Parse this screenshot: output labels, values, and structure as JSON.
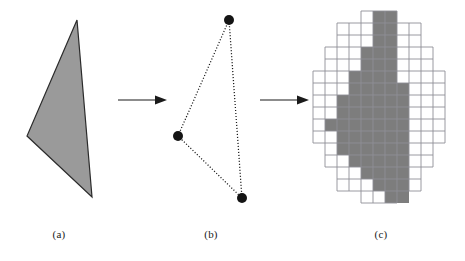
{
  "figure": {
    "background_color": "#ffffff",
    "width": 465,
    "height": 261
  },
  "captions": {
    "a": "(a)",
    "b": "(b)",
    "c": "(c)"
  },
  "colors": {
    "fill_gray": "#9a9a9a",
    "raster_gray": "#7d7d7d",
    "outline_black": "#1a1a1a",
    "grid_line": "#8f8f96",
    "vertex_dot": "#141414",
    "arrow": "#1a1a1a"
  },
  "panel_a": {
    "label": "filled-triangle",
    "shape": "triangle",
    "fill": "#9a9a9a",
    "stroke": "#2b2b2b",
    "stroke_width": 1.2,
    "vertices": [
      {
        "name": "apex-top",
        "x": 77,
        "y": 20
      },
      {
        "name": "left",
        "x": 27,
        "y": 136
      },
      {
        "name": "bottom",
        "x": 92,
        "y": 197
      }
    ]
  },
  "panel_b": {
    "label": "wireframe-triangle-with-vertices",
    "edge_style": "dotted",
    "edge_color": "#1a1a1a",
    "vertex_radius": 5,
    "vertex_color": "#141414",
    "vertices": [
      {
        "name": "apex-top",
        "x": 74,
        "y": 20
      },
      {
        "name": "left",
        "x": 23,
        "y": 136
      },
      {
        "name": "bottom",
        "x": 87,
        "y": 198
      }
    ]
  },
  "panel_c": {
    "label": "rasterized-triangle-on-pixel-grid",
    "cell_size": 12,
    "grid_origin": {
      "x": 8,
      "y": 11
    },
    "grid_cols": 11,
    "grid_rows": 16,
    "grid_line_color": "#8f8f96",
    "grid_line_width": 0.9,
    "pixel_color": "#7d7d7d",
    "filled_runs": [
      {
        "row": 0,
        "col_start": 5,
        "col_end": 6
      },
      {
        "row": 1,
        "col_start": 5,
        "col_end": 6
      },
      {
        "row": 2,
        "col_start": 5,
        "col_end": 6
      },
      {
        "row": 3,
        "col_start": 4,
        "col_end": 6
      },
      {
        "row": 4,
        "col_start": 4,
        "col_end": 6
      },
      {
        "row": 5,
        "col_start": 3,
        "col_end": 6
      },
      {
        "row": 6,
        "col_start": 3,
        "col_end": 7
      },
      {
        "row": 7,
        "col_start": 2,
        "col_end": 7
      },
      {
        "row": 8,
        "col_start": 2,
        "col_end": 7
      },
      {
        "row": 9,
        "col_start": 1,
        "col_end": 7
      },
      {
        "row": 10,
        "col_start": 2,
        "col_end": 7
      },
      {
        "row": 11,
        "col_start": 2,
        "col_end": 7
      },
      {
        "row": 12,
        "col_start": 3,
        "col_end": 7
      },
      {
        "row": 13,
        "col_start": 4,
        "col_end": 7
      },
      {
        "row": 14,
        "col_start": 5,
        "col_end": 7
      },
      {
        "row": 15,
        "col_start": 6,
        "col_end": 7
      }
    ],
    "grid_extent": {
      "lines_v_from": 0,
      "lines_v_to": 11,
      "lines_h_from": 0,
      "lines_h_to": 16
    }
  },
  "arrows": [
    {
      "name": "arrow-a-to-b",
      "from_panel": "a",
      "to_panel": "b",
      "direction": "right"
    },
    {
      "name": "arrow-b-to-c",
      "from_panel": "b",
      "to_panel": "c",
      "direction": "right"
    }
  ]
}
